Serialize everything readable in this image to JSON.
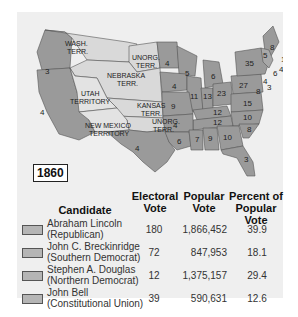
{
  "map": {
    "year": "1860",
    "territories": [
      {
        "name": "WASH. TERR.",
        "line1": "WASH.",
        "line2": "TERR."
      },
      {
        "name": "UNORG. TERR. (north)",
        "line1": "UNORG.",
        "line2": "TERR."
      },
      {
        "name": "NEBRASKA TERR.",
        "line1": "NEBRASKA",
        "line2": "TERR."
      },
      {
        "name": "UTAH TERRITORY",
        "line1": "UTAH",
        "line2": "TERRITORY"
      },
      {
        "name": "KANSAS TERR.",
        "line1": "KANSAS",
        "line2": "TERR."
      },
      {
        "name": "UNORG. TERR. (south)",
        "line1": "UNORG.",
        "line2": "TERR."
      },
      {
        "name": "NEW MEXICO TERRITORY",
        "line1": "NEW MEXICO",
        "line2": "TERRITORY"
      }
    ],
    "electoral_labels": [
      "3",
      "3",
      "4",
      "4",
      "5",
      "6",
      "4",
      "11",
      "13",
      "23",
      "27",
      "35",
      "8",
      "5",
      "5",
      "13",
      "4",
      "6",
      "4",
      "3",
      "8",
      "3",
      "9",
      "12",
      "15",
      "4",
      "12",
      "10",
      "8",
      "7",
      "9",
      "10",
      "6",
      "3",
      "4"
    ]
  },
  "table": {
    "headers": {
      "candidate": "Candidate",
      "electoral_line1": "Electoral",
      "electoral_line2": "Vote",
      "popular_line1": "Popular",
      "popular_line2": "Vote",
      "percent_line1": "Percent of",
      "percent_line2": "Popular Vote"
    },
    "rows": [
      {
        "name": "Abraham Lincoln",
        "party": "(Republican)",
        "electoral": "180",
        "popular": "1,866,452",
        "percent": "39.9"
      },
      {
        "name": "John C. Breckinridge",
        "party": "(Southern Democrat)",
        "electoral": "72",
        "popular": "847,953",
        "percent": "18.1"
      },
      {
        "name": "Stephen A. Douglas",
        "party": "(Northern Democrat)",
        "electoral": "12",
        "popular": "1,375,157",
        "percent": "29.4"
      },
      {
        "name": "John Bell",
        "party": "(Constitutional Union)",
        "electoral": "39",
        "popular": "590,631",
        "percent": "12.6"
      }
    ]
  },
  "colors": {
    "panel_bg": "#efefef",
    "state_fill": "#9a9a9a",
    "territory_fill": "#d9d9d9",
    "swatch": "#b5b5b5"
  }
}
